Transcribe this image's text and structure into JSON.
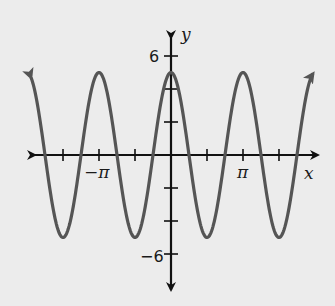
{
  "chart_data": {
    "type": "line",
    "title": "",
    "function": "y = 5cos(2x)",
    "xlabel": "x",
    "ylabel": "y",
    "xlim": [
      -4.5,
      4.5
    ],
    "ylim": [
      -7,
      7
    ],
    "x_ticks": [
      {
        "value": -4.712,
        "label": ""
      },
      {
        "value": -3.1416,
        "label": "−π"
      },
      {
        "value": -1.5708,
        "label": ""
      },
      {
        "value": 1.5708,
        "label": ""
      },
      {
        "value": 3.1416,
        "label": "π"
      },
      {
        "value": 4.712,
        "label": ""
      }
    ],
    "y_ticks": [
      {
        "value": 6,
        "label": "6"
      },
      {
        "value": 4,
        "label": ""
      },
      {
        "value": 2,
        "label": ""
      },
      {
        "value": -2,
        "label": ""
      },
      {
        "value": -4,
        "label": ""
      },
      {
        "value": -6,
        "label": "−6"
      }
    ],
    "series": [
      {
        "name": "5cos(2x)",
        "amplitude": 5,
        "frequency": 2,
        "x": [
          -4.712,
          -3.927,
          -3.1416,
          -2.356,
          -1.5708,
          -0.785,
          0,
          0.785,
          1.5708,
          2.356,
          3.1416,
          3.927,
          4.712
        ],
        "values": [
          -5,
          0,
          5,
          0,
          -5,
          0,
          5,
          0,
          -5,
          0,
          5,
          0,
          -5
        ]
      }
    ],
    "grid": false,
    "legend": "none",
    "arrows": {
      "curve_ends": true,
      "axes": true
    }
  },
  "labels": {
    "x_axis": "x",
    "y_axis": "y",
    "neg_pi": "−π",
    "pi": "π",
    "six": "6",
    "neg_six": "−6"
  },
  "colors": {
    "background": "#ececec",
    "curve": "#555555",
    "axis": "#111111"
  }
}
